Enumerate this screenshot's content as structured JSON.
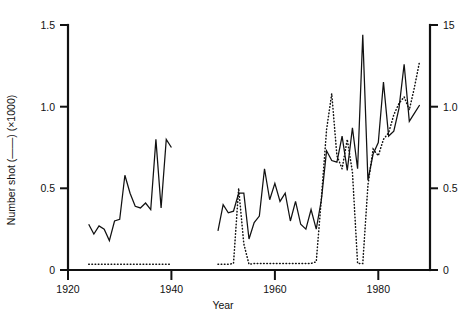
{
  "chart_data": {
    "type": "line",
    "title": "",
    "xlabel": "Year",
    "ylabel_left": "Number shot (——) (×1000)",
    "ylabel_right": "",
    "xlim": [
      1918,
      1988
    ],
    "ylim_left": [
      0,
      1.5
    ],
    "ylim_right": [
      0,
      1.5
    ],
    "xticks": [
      1920,
      1940,
      1960,
      1980
    ],
    "xticklabels": [
      "1920",
      "1940",
      "1960",
      "1980"
    ],
    "yticks_left": [
      0,
      0.5,
      1.0,
      1.5
    ],
    "yticklabels_left": [
      "0",
      "0.5",
      "1.0",
      "1.5"
    ],
    "yticks_right": [
      0,
      0.5,
      1.0,
      1.5
    ],
    "yticklabels_right": [
      "0",
      "0.5",
      "1.0",
      "15"
    ],
    "grid": false,
    "legend": "none",
    "legend_note_solid": "——",
    "legend_note_dotted": "······",
    "series": [
      {
        "name": "Number shot (solid)",
        "style": "solid",
        "axis": "left",
        "segments": [
          {
            "x": [
              1922,
              1923,
              1924,
              1925,
              1926,
              1927,
              1928,
              1929,
              1930,
              1931,
              1932,
              1933,
              1934,
              1935,
              1936,
              1937,
              1938
            ],
            "y": [
              0.28,
              0.22,
              0.27,
              0.25,
              0.18,
              0.3,
              0.31,
              0.58,
              0.47,
              0.39,
              0.38,
              0.41,
              0.37,
              0.8,
              0.38,
              0.8,
              0.75
            ]
          },
          {
            "x": [
              1947,
              1948,
              1949,
              1950,
              1951,
              1952,
              1953,
              1954,
              1955,
              1956,
              1957,
              1958,
              1959,
              1960,
              1961,
              1962,
              1963,
              1964,
              1965,
              1966,
              1967,
              1968,
              1969,
              1970,
              1971,
              1972,
              1973,
              1974,
              1975,
              1976,
              1977,
              1978,
              1979,
              1980,
              1981,
              1982,
              1983,
              1984,
              1985,
              1986
            ],
            "y": [
              0.24,
              0.4,
              0.35,
              0.36,
              0.47,
              0.47,
              0.19,
              0.29,
              0.33,
              0.62,
              0.43,
              0.53,
              0.42,
              0.47,
              0.3,
              0.42,
              0.28,
              0.25,
              0.37,
              0.25,
              0.43,
              0.73,
              0.67,
              0.66,
              0.82,
              0.61,
              0.87,
              0.62,
              1.44,
              0.55,
              0.71,
              0.78,
              1.15,
              0.82,
              0.85,
              0.99,
              1.26,
              0.91,
              0.96,
              1.01
            ]
          }
        ]
      },
      {
        "name": "Population index (dotted)",
        "style": "dotted",
        "axis": "right",
        "segments": [
          {
            "x": [
              1922,
              1926,
              1930,
              1934,
              1938
            ],
            "y": [
              0.035,
              0.035,
              0.035,
              0.035,
              0.035
            ]
          },
          {
            "x": [
              1947,
              1948,
              1949,
              1950,
              1951,
              1952,
              1953,
              1954,
              1955,
              1956,
              1957,
              1958,
              1959,
              1960,
              1961,
              1962,
              1963,
              1964,
              1965,
              1966,
              1967,
              1968,
              1969,
              1970,
              1971,
              1972,
              1973,
              1974,
              1975,
              1976,
              1977,
              1978,
              1979,
              1980,
              1981,
              1982,
              1983,
              1984,
              1985,
              1986
            ],
            "y": [
              0.035,
              0.035,
              0.035,
              0.04,
              0.5,
              0.16,
              0.035,
              0.04,
              0.04,
              0.04,
              0.04,
              0.04,
              0.04,
              0.04,
              0.04,
              0.04,
              0.04,
              0.04,
              0.04,
              0.05,
              0.44,
              0.86,
              1.08,
              0.7,
              0.62,
              0.8,
              0.6,
              0.04,
              0.04,
              0.52,
              0.74,
              0.7,
              0.8,
              0.84,
              0.95,
              1.02,
              1.06,
              0.98,
              1.12,
              1.28
            ]
          }
        ]
      }
    ]
  },
  "labels": {
    "y_axis_left_title": "Number shot (——) (×1000)",
    "x_axis_title": "Year",
    "y_left_tick_0": "0",
    "y_left_tick_1": "0.5",
    "y_left_tick_2": "1.0",
    "y_left_tick_3": "1.5",
    "y_right_tick_0": "0",
    "y_right_tick_1": "0.5",
    "y_right_tick_2": "1.0",
    "y_right_tick_3": "15",
    "x_tick_0": "1920",
    "x_tick_1": "1940",
    "x_tick_2": "1960",
    "x_tick_3": "1980"
  },
  "colors": {
    "ink": "#111111",
    "background": "#ffffff"
  }
}
